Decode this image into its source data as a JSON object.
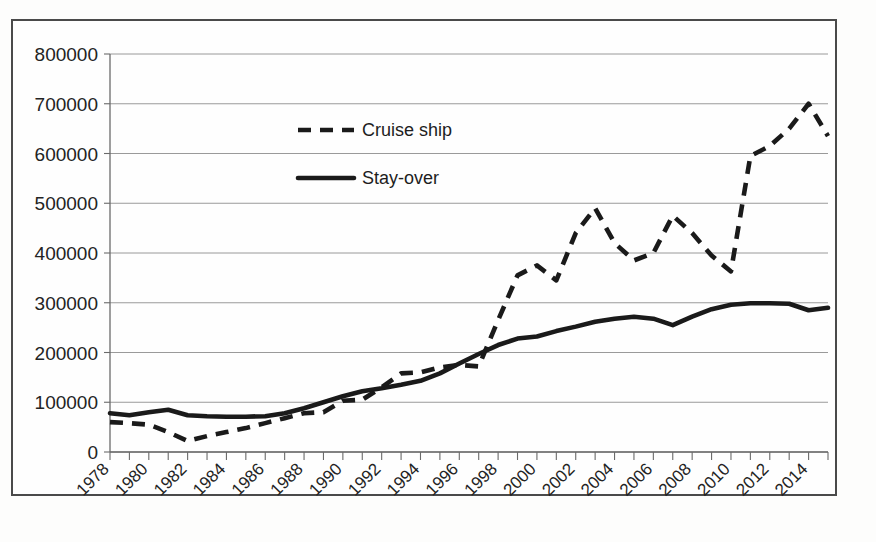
{
  "chart_data": {
    "type": "line",
    "title": "",
    "subtitle": "",
    "xlabel": "",
    "ylabel": "",
    "ylim": [
      0,
      800000
    ],
    "xlim": [
      1978,
      2015
    ],
    "grid": true,
    "legend_position": "inside-upper-left",
    "y_ticks": [
      0,
      100000,
      200000,
      300000,
      400000,
      500000,
      600000,
      700000,
      800000
    ],
    "y_tick_labels": [
      "0",
      "100000",
      "200000",
      "300000",
      "400000",
      "500000",
      "600000",
      "700000",
      "800000"
    ],
    "x": [
      1978,
      1979,
      1980,
      1981,
      1982,
      1983,
      1984,
      1985,
      1986,
      1987,
      1988,
      1989,
      1990,
      1991,
      1992,
      1993,
      1994,
      1995,
      1996,
      1997,
      1998,
      1999,
      2000,
      2001,
      2002,
      2003,
      2004,
      2005,
      2006,
      2007,
      2008,
      2009,
      2010,
      2011,
      2012,
      2013,
      2014,
      2015
    ],
    "x_tick_labels": [
      "1978",
      "",
      "1980",
      "",
      "1982",
      "",
      "1984",
      "",
      "1986",
      "",
      "1988",
      "",
      "1990",
      "",
      "1992",
      "",
      "1994",
      "",
      "1996",
      "",
      "1998",
      "",
      "2000",
      "",
      "2002",
      "",
      "2004",
      "",
      "2006",
      "",
      "2008",
      "",
      "2010",
      "",
      "2012",
      "",
      "2014",
      ""
    ],
    "x_labeled_years": [
      "1978",
      "1980",
      "1982",
      "1984",
      "1986",
      "1988",
      "1990",
      "1992",
      "1994",
      "1996",
      "1998",
      "2000",
      "2002",
      "2004",
      "2006",
      "2008",
      "2010",
      "2012",
      "2014"
    ],
    "series": [
      {
        "name": "Cruise ship",
        "style": "dashed",
        "color": "#1a1a1a",
        "values": [
          60000,
          58000,
          55000,
          40000,
          22000,
          32000,
          40000,
          48000,
          58000,
          68000,
          78000,
          80000,
          103000,
          105000,
          130000,
          158000,
          160000,
          170000,
          175000,
          172000,
          265000,
          355000,
          375000,
          345000,
          440000,
          490000,
          420000,
          385000,
          400000,
          475000,
          440000,
          395000,
          363000,
          595000,
          615000,
          650000,
          700000,
          635000
        ]
      },
      {
        "name": "Stay-over",
        "style": "solid",
        "color": "#1a1a1a",
        "values": [
          78000,
          74000,
          80000,
          85000,
          74000,
          72000,
          71000,
          71000,
          72000,
          78000,
          88000,
          100000,
          112000,
          122000,
          128000,
          135000,
          143000,
          158000,
          178000,
          197000,
          215000,
          228000,
          232000,
          243000,
          252000,
          262000,
          268000,
          272000,
          268000,
          255000,
          272000,
          287000,
          296000,
          299000,
          299000,
          298000,
          285000,
          290000
        ]
      }
    ],
    "series_tail": {
      "Cruise ship": [
        570000,
        575000,
        600000,
        640000,
        678000
      ],
      "Stay-over": [
        278000,
        295000,
        305000,
        307000,
        303000,
        312000,
        330000,
        342000
      ]
    }
  },
  "legend": {
    "entries": [
      {
        "label": "Cruise ship",
        "style": "dashed"
      },
      {
        "label": "Stay-over",
        "style": "solid"
      }
    ]
  }
}
